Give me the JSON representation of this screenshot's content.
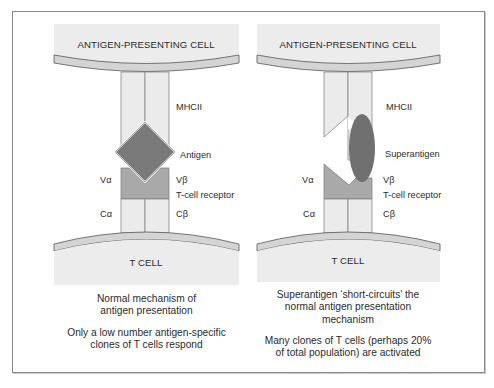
{
  "panels": [
    {
      "apc_label": "ANTIGEN-PRESENTING CELL",
      "tcell_label": "T CELL",
      "labels": {
        "mhc": "MHCII",
        "antigen": "Antigen",
        "v_alpha": "Vα",
        "v_beta": "Vβ",
        "tcr": "T-cell receptor",
        "c_alpha": "Cα",
        "c_beta": "Cβ"
      },
      "caption_1": [
        "Normal mechanism of",
        "antigen presentation"
      ],
      "caption_2": [
        "Only a low number antigen-specific",
        "clones of T cells respond"
      ]
    },
    {
      "apc_label": "ANTIGEN-PRESENTING CELL",
      "tcell_label": "T CELL",
      "labels": {
        "mhc": "MHCII",
        "antigen": "Superantigen",
        "v_alpha": "Vα",
        "v_beta": "Vβ",
        "tcr": "T-cell receptor",
        "c_alpha": "Cα",
        "c_beta": "Cβ"
      },
      "caption_1": [
        "Superantigen ‘short-circuits’ the",
        "normal antigen presentation",
        "mechanism"
      ],
      "caption_2": [
        "Many clones of T cells (perhaps 20%",
        "of total population) are activated"
      ]
    }
  ],
  "colors": {
    "cell_fill": "#ececec",
    "membrane_fill": "#d6d6d6",
    "chain_fill": "#ebebeb",
    "v_region_fill": "#a9a9a9",
    "antigen_fill": "#7a7a7a",
    "superantigen_fill": "#707070",
    "outline": "#5a5a5a"
  }
}
